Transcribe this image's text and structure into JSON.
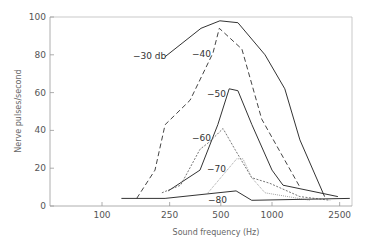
{
  "chart_data": {
    "type": "line",
    "title": "",
    "xlabel": "Sound frequency (Hz)",
    "ylabel": "Nerve pulses/second",
    "x_scale": "log",
    "xlim": [
      70,
      2900
    ],
    "ylim": [
      0,
      100
    ],
    "x_ticks": [
      100,
      250,
      500,
      1000,
      2500
    ],
    "x_tick_labels": [
      "100",
      "250",
      "500",
      "1000",
      "2500"
    ],
    "y_ticks": [
      0,
      20,
      40,
      60,
      80,
      100
    ],
    "y_tick_labels": [
      "0",
      "20",
      "40",
      "60",
      "80",
      "100"
    ],
    "grid": false,
    "legend": "inline labels",
    "series": [
      {
        "name": "-30 db",
        "style": "solid",
        "points": [
          [
            235,
            79
          ],
          [
            382,
            94
          ],
          [
            494,
            98
          ],
          [
            630,
            97
          ],
          [
            910,
            80
          ],
          [
            1190,
            62
          ],
          [
            1460,
            35
          ],
          [
            2040,
            5
          ]
        ]
      },
      {
        "name": "-40",
        "style": "dashed",
        "points": [
          [
            160,
            4
          ],
          [
            205,
            19
          ],
          [
            235,
            43
          ],
          [
            330,
            56
          ],
          [
            450,
            81
          ],
          [
            490,
            94
          ],
          [
            665,
            83
          ],
          [
            870,
            46
          ],
          [
            1460,
            10
          ]
        ]
      },
      {
        "name": "-50",
        "style": "solid",
        "points": [
          [
            245,
            8
          ],
          [
            377,
            19
          ],
          [
            480,
            43
          ],
          [
            560,
            62
          ],
          [
            630,
            61
          ],
          [
            762,
            43
          ],
          [
            1000,
            19
          ],
          [
            1160,
            11
          ],
          [
            2440,
            5
          ]
        ]
      },
      {
        "name": "-60",
        "style": "dashed-fine",
        "points": [
          [
            225,
            7
          ],
          [
            290,
            11
          ],
          [
            377,
            30
          ],
          [
            430,
            34
          ],
          [
            515,
            41
          ],
          [
            605,
            30
          ],
          [
            760,
            15
          ],
          [
            970,
            12
          ],
          [
            1460,
            5
          ],
          [
            2200,
            3
          ]
        ]
      },
      {
        "name": "-70",
        "style": "dotted",
        "points": [
          [
            420,
            7
          ],
          [
            620,
            25
          ],
          [
            675,
            25
          ],
          [
            760,
            15
          ],
          [
            910,
            7
          ],
          [
            1670,
            3
          ]
        ]
      },
      {
        "name": "-80",
        "style": "solid",
        "points": [
          [
            130,
            4
          ],
          [
            235,
            4
          ],
          [
            377,
            6
          ],
          [
            615,
            8
          ],
          [
            760,
            3
          ],
          [
            2870,
            4
          ]
        ]
      }
    ],
    "annotations": [
      {
        "text": "-30 db",
        "near_series": "-30 db"
      },
      {
        "text": "-40",
        "near_series": "-40"
      },
      {
        "text": "-50",
        "near_series": "-50"
      },
      {
        "text": "-60",
        "near_series": "-60"
      },
      {
        "text": "-70",
        "near_series": "-70"
      },
      {
        "text": "-80",
        "near_series": "-80"
      }
    ]
  },
  "axes": {
    "xlabel": "Sound frequency (Hz)",
    "ylabel": "Nerve pulses/second"
  },
  "labels": {
    "l30": "−30 db",
    "l40": "−40",
    "l50": "−50",
    "l60": "−60",
    "l70": "−70",
    "l80": "−80"
  }
}
